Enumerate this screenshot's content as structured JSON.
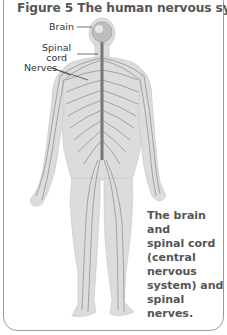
{
  "figure": {
    "title": "Figure 5  The human nervous system",
    "labels": {
      "brain": "Brain",
      "spinal_cord_line1": "Spinal",
      "spinal_cord_line2": "cord",
      "nerves": "Nerves"
    },
    "caption": {
      "line1": "The brain and",
      "line2": "spinal cord",
      "line3": "(central",
      "line4": "nervous",
      "line5": "system) and",
      "line6": "spinal nerves."
    },
    "colors": {
      "body_fill": "#d9d9d9",
      "nerve_stroke": "#7a7a7a",
      "text": "#555555",
      "border": "#9a9a9a"
    }
  }
}
